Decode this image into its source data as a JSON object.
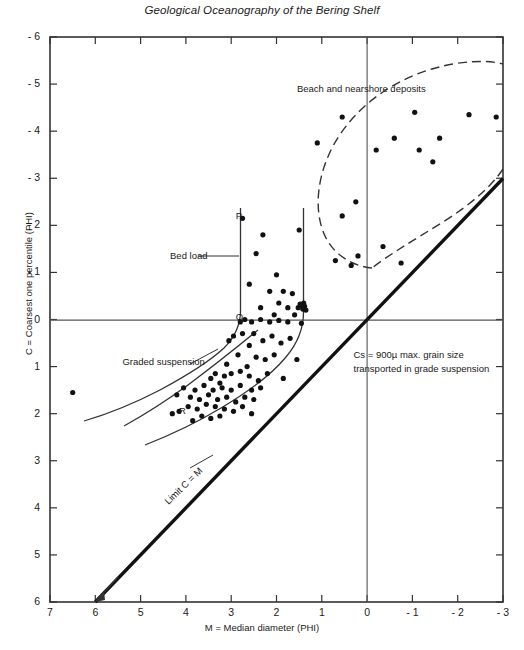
{
  "chart_data": {
    "type": "scatter",
    "title": "Geological Oceanography of the Bering Shelf",
    "xlabel": "M = Median diameter (PHI)",
    "ylabel": "C = Coarsest one percentile (PHI)",
    "xlim": [
      7,
      -3
    ],
    "ylim": [
      6,
      -6
    ],
    "xticks": [
      "7",
      "6",
      "5",
      "4",
      "3",
      "2",
      "1",
      "0",
      "- 1",
      "- 2",
      "- 3"
    ],
    "xtick_values": [
      7,
      6,
      5,
      4,
      3,
      2,
      1,
      0,
      -1,
      -2,
      -3
    ],
    "yticks": [
      "- 6",
      "- 5",
      "- 4",
      "- 3",
      "- 2",
      "- 1",
      "0",
      "1",
      "2",
      "3",
      "4",
      "5",
      "6"
    ],
    "ytick_values": [
      -6,
      -5,
      -4,
      -3,
      -2,
      -1,
      0,
      1,
      2,
      3,
      4,
      5,
      6
    ],
    "grid": false,
    "legend": "none",
    "annotations": [
      {
        "name": "beach-and-nearshore-deposits",
        "text": "Beach and nearshore deposits",
        "x": 1.55,
        "y": -4.9
      },
      {
        "name": "bed-load",
        "text": "Bed load",
        "x": 4.35,
        "y": -1.35
      },
      {
        "name": "graded-suspension",
        "text": "Graded suspension",
        "x": 5.4,
        "y": 0.9
      },
      {
        "name": "cs-max-grain-size",
        "text": "Cs = 900µ max. grain size",
        "x": 0.3,
        "y": 0.75
      },
      {
        "name": "cs-transported-line2",
        "text": "transported in grade suspension",
        "x": 0.3,
        "y": 1.05
      },
      {
        "name": "limit-c-equals-m",
        "text": "Limit C = M",
        "x": 3.0,
        "y": 3.6
      },
      {
        "name": "point-p",
        "text": "P",
        "x": 2.9,
        "y": -2.2
      },
      {
        "name": "point-q",
        "text": "Q",
        "x": 2.9,
        "y": -0.05
      },
      {
        "name": "point-r",
        "text": "R",
        "x": 4.15,
        "y": 1.95
      }
    ],
    "reference_lines": [
      {
        "name": "c-equals-zero-line",
        "type": "horizontal",
        "value": 0
      },
      {
        "name": "m-equals-zero-line",
        "type": "vertical",
        "value": 0
      },
      {
        "name": "limit-c-equals-m-line",
        "type": "diagonal",
        "from": [
          6,
          6
        ],
        "to": [
          -3,
          -3
        ]
      }
    ],
    "series": [
      {
        "name": "Beach and nearshore deposits",
        "marker": "filled-circle",
        "points": [
          [
            1.1,
            -3.75
          ],
          [
            0.55,
            -4.3
          ],
          [
            -1.15,
            -3.6
          ],
          [
            -0.6,
            -3.85
          ],
          [
            -1.6,
            -3.85
          ],
          [
            -2.25,
            -4.35
          ],
          [
            -2.85,
            -4.3
          ],
          [
            -1.05,
            -4.4
          ],
          [
            0.25,
            -2.5
          ],
          [
            0.55,
            -2.2
          ],
          [
            0.7,
            -1.25
          ],
          [
            0.2,
            -1.35
          ],
          [
            -0.35,
            -1.55
          ],
          [
            0.35,
            -1.15
          ],
          [
            -0.75,
            -1.2
          ],
          [
            -1.45,
            -3.35
          ],
          [
            -0.2,
            -3.6
          ]
        ]
      },
      {
        "name": "Bed load and graded suspension samples",
        "marker": "filled-circle",
        "points": [
          [
            6.5,
            1.55
          ],
          [
            2.75,
            -2.15
          ],
          [
            2.3,
            -1.8
          ],
          [
            1.5,
            -1.9
          ],
          [
            2.45,
            -1.4
          ],
          [
            2.6,
            -0.75
          ],
          [
            2.0,
            -0.95
          ],
          [
            2.15,
            -0.6
          ],
          [
            1.85,
            -0.6
          ],
          [
            1.65,
            -0.55
          ],
          [
            1.95,
            -0.35
          ],
          [
            1.75,
            -0.25
          ],
          [
            1.45,
            -0.3
          ],
          [
            1.4,
            -0.35
          ],
          [
            1.38,
            -0.28
          ],
          [
            1.42,
            -0.22
          ],
          [
            1.35,
            -0.2
          ],
          [
            1.48,
            -0.33
          ],
          [
            1.52,
            -0.25
          ],
          [
            2.35,
            -0.25
          ],
          [
            2.05,
            -0.1
          ],
          [
            1.6,
            -0.1
          ],
          [
            2.55,
            0.05
          ],
          [
            2.35,
            0.0
          ],
          [
            2.15,
            0.05
          ],
          [
            1.95,
            0.02
          ],
          [
            1.75,
            0.05
          ],
          [
            2.8,
            0.05
          ],
          [
            2.7,
            0.0
          ],
          [
            1.45,
            0.08
          ],
          [
            2.95,
            0.35
          ],
          [
            2.75,
            0.3
          ],
          [
            3.05,
            0.45
          ],
          [
            2.5,
            0.3
          ],
          [
            2.3,
            0.45
          ],
          [
            2.6,
            0.55
          ],
          [
            2.1,
            0.35
          ],
          [
            1.9,
            0.5
          ],
          [
            1.7,
            0.4
          ],
          [
            2.85,
            0.75
          ],
          [
            2.45,
            0.8
          ],
          [
            2.25,
            0.85
          ],
          [
            2.05,
            0.75
          ],
          [
            3.1,
            0.95
          ],
          [
            2.65,
            1.0
          ],
          [
            1.55,
            0.85
          ],
          [
            3.35,
            1.15
          ],
          [
            3.15,
            1.2
          ],
          [
            3.0,
            1.15
          ],
          [
            2.8,
            1.1
          ],
          [
            2.6,
            1.2
          ],
          [
            2.4,
            1.3
          ],
          [
            2.2,
            1.15
          ],
          [
            3.45,
            1.25
          ],
          [
            3.25,
            1.35
          ],
          [
            3.6,
            1.4
          ],
          [
            3.4,
            1.5
          ],
          [
            3.2,
            1.45
          ],
          [
            3.0,
            1.5
          ],
          [
            2.8,
            1.4
          ],
          [
            2.55,
            1.5
          ],
          [
            2.35,
            1.45
          ],
          [
            3.8,
            1.5
          ],
          [
            4.05,
            1.45
          ],
          [
            3.9,
            1.65
          ],
          [
            3.7,
            1.7
          ],
          [
            3.5,
            1.6
          ],
          [
            3.3,
            1.7
          ],
          [
            3.1,
            1.65
          ],
          [
            2.9,
            1.75
          ],
          [
            2.7,
            1.65
          ],
          [
            2.5,
            1.7
          ],
          [
            4.2,
            1.6
          ],
          [
            3.95,
            1.85
          ],
          [
            3.75,
            1.9
          ],
          [
            3.55,
            1.8
          ],
          [
            3.35,
            1.85
          ],
          [
            3.15,
            1.9
          ],
          [
            2.95,
            1.95
          ],
          [
            2.75,
            1.85
          ],
          [
            4.15,
            1.95
          ],
          [
            3.65,
            2.05
          ],
          [
            3.45,
            2.1
          ],
          [
            3.25,
            2.05
          ],
          [
            4.3,
            2.0
          ],
          [
            3.85,
            2.15
          ],
          [
            2.55,
            2.0
          ],
          [
            1.85,
            1.25
          ]
        ]
      }
    ],
    "curves": [
      {
        "name": "bed-load-envelope-pq",
        "style": "solid"
      },
      {
        "name": "bed-load-envelope-right",
        "style": "solid"
      },
      {
        "name": "graded-suspension-envelope",
        "style": "solid"
      },
      {
        "name": "beach-nearshore-outline",
        "style": "dashed"
      }
    ]
  },
  "ui": {
    "figure_name": "cm-diagram"
  }
}
